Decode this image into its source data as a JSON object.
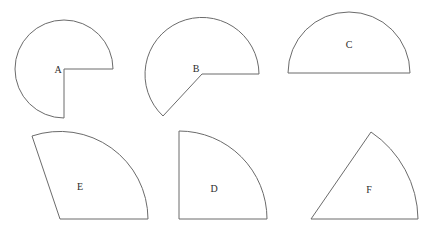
{
  "figure": {
    "canvas": {
      "width": 438,
      "height": 239,
      "background": "#ffffff"
    },
    "style": {
      "stroke": "#6b6b6b",
      "stroke_width": 1,
      "fill": "#ffffff",
      "label_color": "#2b2b2b"
    },
    "shapes": [
      {
        "id": "A",
        "label": "A",
        "type": "three-quarter-circle",
        "description": "Full circle with a quarter (lower-right quadrant) removed",
        "center": {
          "x": 64,
          "y": 69
        },
        "radius": 49,
        "sweep_degrees": 270,
        "start_angle_degrees": 0,
        "end_angle_degrees": 270,
        "label_position": {
          "x": 58,
          "y": 71
        },
        "path": "M 113 69 L 64 69 L 64 118 A 49 49 0 1 1 113 69 Z"
      },
      {
        "id": "B",
        "label": "B",
        "type": "circular-sector",
        "description": "Sector larger than a semicircle, vertex at center",
        "center": {
          "x": 202,
          "y": 74
        },
        "radius": 57,
        "sweep_degrees": 227,
        "start_angle_degrees": 0,
        "end_angle_degrees": 227,
        "label_position": {
          "x": 196,
          "y": 70
        },
        "path": "M 259 74 L 202 74 L 163 116 A 57 57 0 1 1 259 74 Z"
      },
      {
        "id": "C",
        "label": "C",
        "type": "semicircle",
        "description": "Half circle with flat diameter along the bottom",
        "center": {
          "x": 349,
          "y": 73
        },
        "radius": 61,
        "sweep_degrees": 180,
        "start_angle_degrees": 0,
        "end_angle_degrees": 180,
        "label_position": {
          "x": 349,
          "y": 46
        },
        "path": "M 288 73 L 410 73 A 61 61 0 0 0 288 73 Z"
      },
      {
        "id": "E",
        "label": "E",
        "type": "circular-sector",
        "description": "Sector slightly larger than a quarter circle, vertex at lower left",
        "center": {
          "x": 60,
          "y": 219
        },
        "radius": 88,
        "sweep_degrees": 109,
        "start_angle_degrees": 0,
        "end_angle_degrees": 109,
        "label_position": {
          "x": 80,
          "y": 188
        },
        "path": "M 148 219 L 60 219 L 32 136 A 88 88 0 0 1 148 219 Z"
      },
      {
        "id": "D",
        "label": "D",
        "type": "quarter-circle",
        "description": "Quarter circle with right angle at lower left",
        "center": {
          "x": 179,
          "y": 219
        },
        "radius": 88,
        "sweep_degrees": 90,
        "start_angle_degrees": 0,
        "end_angle_degrees": 90,
        "label_position": {
          "x": 214,
          "y": 190
        },
        "path": "M 267 219 L 179 219 L 179 131 A 88 88 0 0 1 267 219 Z"
      },
      {
        "id": "F",
        "label": "F",
        "type": "circular-sector",
        "description": "Narrow sector, vertex at lower left, arc on the right",
        "center": {
          "x": 311,
          "y": 219
        },
        "radius": 107,
        "sweep_degrees": 55,
        "start_angle_degrees": 0,
        "end_angle_degrees": 55,
        "label_position": {
          "x": 369,
          "y": 191
        },
        "path": "M 418 219 L 311 219 L 371 132 A 107 107 0 0 1 418 219 Z"
      }
    ]
  }
}
